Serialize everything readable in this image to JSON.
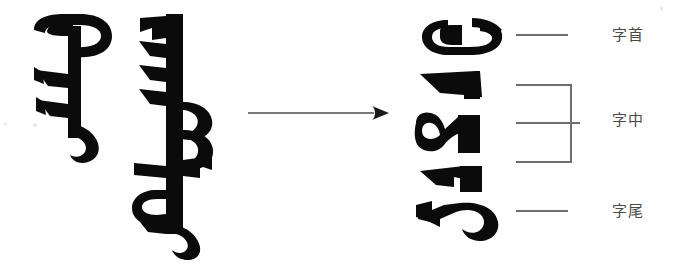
{
  "figure": {
    "kind": "scanned-linguistics-diagram",
    "background_color": "#fefefe",
    "ink_color": "#0b0b0b",
    "rule_color": "#6e6e6e",
    "label_color": "#4a4a4a",
    "width": 684,
    "height": 270
  },
  "source_words": {
    "description": "Two vertically-written Mongolian script words shown on the left of the arrow",
    "items": [
      {
        "name": "word-one",
        "script": "Mongolian",
        "orientation": "vertical"
      },
      {
        "name": "word-two",
        "script": "Mongolian",
        "orientation": "vertical"
      }
    ]
  },
  "arrow": {
    "direction": "right",
    "style": "solid-line-with-filled-head",
    "color": "#4d4d4d"
  },
  "decomposed_forms": {
    "description": "Isolated positional letter forms extracted from the words, stacked vertically",
    "items": [
      {
        "name": "form-1",
        "position_class": "initial"
      },
      {
        "name": "form-2",
        "position_class": "medial"
      },
      {
        "name": "form-3",
        "position_class": "medial"
      },
      {
        "name": "form-4",
        "position_class": "medial"
      },
      {
        "name": "form-5",
        "position_class": "final"
      }
    ]
  },
  "annotations": {
    "initial": {
      "label": "字首",
      "connector": "plain-rule"
    },
    "medial": {
      "label": "字中",
      "connector": "right-facing-brace"
    },
    "final": {
      "label": "字尾",
      "connector": "plain-rule"
    }
  }
}
